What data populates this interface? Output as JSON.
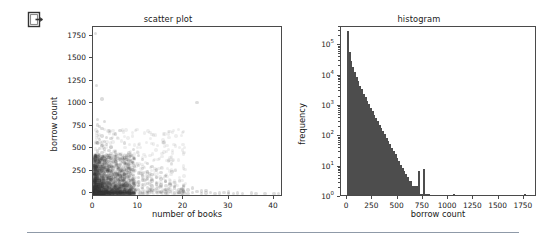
{
  "icon": {
    "name": "export-logout-icon"
  },
  "chart_data": [
    {
      "type": "scatter",
      "title": "scatter plot",
      "xlabel": "number of books",
      "ylabel": "borrow count",
      "xlim": [
        0,
        42
      ],
      "ylim": [
        -40,
        1850
      ],
      "xticks": [
        0,
        10,
        20,
        30,
        40
      ],
      "xtick_labels": [
        "0",
        "10",
        "20",
        "30",
        "40"
      ],
      "yticks": [
        0,
        250,
        500,
        750,
        1000,
        1250,
        1500,
        1750
      ],
      "ytick_labels": [
        "0",
        "250",
        "500",
        "750",
        "1000",
        "1250",
        "1500",
        "1750"
      ],
      "grid": false,
      "legend": "none",
      "marker_color": "#3f3f3f",
      "marker_alpha": 0.18,
      "description": "Dense semi-transparent cluster of points concentrated at low number-of-books (0-8) and low borrow count (0-400), thinning out toward higher values; a few sparse outliers up to 40 books and up to 1780 borrows.",
      "points": [
        [
          0.5,
          1780
        ],
        [
          1,
          760
        ],
        [
          1.5,
          745
        ],
        [
          2,
          720
        ],
        [
          1,
          690
        ],
        [
          2,
          640
        ],
        [
          3,
          620
        ],
        [
          1.5,
          600
        ],
        [
          2.5,
          580
        ],
        [
          1,
          560
        ],
        [
          3,
          545
        ],
        [
          2,
          530
        ],
        [
          4,
          515
        ],
        [
          1.5,
          500
        ],
        [
          2.5,
          495
        ],
        [
          3.5,
          480
        ],
        [
          1,
          470
        ],
        [
          5,
          460
        ],
        [
          2,
          455
        ],
        [
          4,
          445
        ],
        [
          3,
          435
        ],
        [
          6,
          430
        ],
        [
          1.5,
          425
        ],
        [
          2.5,
          415
        ],
        [
          5,
          405
        ],
        [
          3.5,
          400
        ],
        [
          7,
          395
        ],
        [
          2,
          390
        ],
        [
          4,
          385
        ],
        [
          1,
          380
        ],
        [
          6,
          375
        ],
        [
          3,
          370
        ],
        [
          8,
          365
        ],
        [
          2.5,
          360
        ],
        [
          5,
          355
        ],
        [
          1.5,
          350
        ],
        [
          4.5,
          345
        ],
        [
          9,
          340
        ],
        [
          3,
          335
        ],
        [
          7,
          330
        ],
        [
          2,
          325
        ],
        [
          6,
          320
        ],
        [
          1,
          315
        ],
        [
          10,
          310
        ],
        [
          4,
          305
        ],
        [
          3.5,
          300
        ],
        [
          8,
          295
        ],
        [
          2.5,
          290
        ],
        [
          5.5,
          285
        ],
        [
          1.5,
          280
        ],
        [
          11,
          275
        ],
        [
          7,
          270
        ],
        [
          3,
          265
        ],
        [
          9,
          260
        ],
        [
          2,
          255
        ],
        [
          6,
          250
        ],
        [
          4,
          245
        ],
        [
          12,
          240
        ],
        [
          1,
          238
        ],
        [
          8,
          235
        ],
        [
          5,
          230
        ],
        [
          3.5,
          228
        ],
        [
          10,
          225
        ],
        [
          2.5,
          220
        ],
        [
          7,
          215
        ],
        [
          13,
          212
        ],
        [
          4.5,
          208
        ],
        [
          1.5,
          205
        ],
        [
          9,
          200
        ],
        [
          6,
          198
        ],
        [
          3,
          195
        ],
        [
          11,
          192
        ],
        [
          2,
          190
        ],
        [
          8,
          188
        ],
        [
          5,
          185
        ],
        [
          14,
          182
        ],
        [
          4,
          180
        ],
        [
          1,
          178
        ],
        [
          10,
          175
        ],
        [
          7,
          172
        ],
        [
          3.5,
          170
        ],
        [
          12,
          168
        ],
        [
          2.5,
          165
        ],
        [
          6,
          162
        ],
        [
          9,
          160
        ],
        [
          15,
          158
        ],
        [
          5.5,
          155
        ],
        [
          4,
          152
        ],
        [
          1.5,
          150
        ],
        [
          11,
          148
        ],
        [
          8,
          145
        ],
        [
          3,
          142
        ],
        [
          13,
          140
        ],
        [
          2,
          138
        ],
        [
          7,
          135
        ],
        [
          6,
          132
        ],
        [
          16,
          130
        ],
        [
          10,
          128
        ],
        [
          4.5,
          125
        ],
        [
          5,
          122
        ],
        [
          1,
          120
        ],
        [
          9,
          118
        ],
        [
          3.5,
          115
        ],
        [
          12,
          112
        ],
        [
          2.5,
          110
        ],
        [
          8,
          108
        ],
        [
          14,
          105
        ],
        [
          6.5,
          102
        ],
        [
          4,
          100
        ],
        [
          11,
          98
        ],
        [
          1.5,
          96
        ],
        [
          7,
          94
        ],
        [
          17,
          92
        ],
        [
          5,
          90
        ],
        [
          3,
          88
        ],
        [
          10,
          86
        ],
        [
          13,
          84
        ],
        [
          2,
          82
        ],
        [
          8.5,
          80
        ],
        [
          6,
          78
        ],
        [
          15,
          76
        ],
        [
          4.5,
          74
        ],
        [
          9,
          72
        ],
        [
          1,
          70
        ],
        [
          12,
          68
        ],
        [
          3.5,
          66
        ],
        [
          7.5,
          64
        ],
        [
          18,
          62
        ],
        [
          5.5,
          60
        ],
        [
          2.5,
          58
        ],
        [
          11,
          56
        ],
        [
          14,
          54
        ],
        [
          8,
          52
        ],
        [
          4,
          50
        ],
        [
          6,
          48
        ],
        [
          16,
          46
        ],
        [
          10,
          44
        ],
        [
          1.5,
          42
        ],
        [
          9.5,
          40
        ],
        [
          3,
          38
        ],
        [
          13,
          36
        ],
        [
          20,
          34
        ],
        [
          7,
          32
        ],
        [
          5,
          30
        ],
        [
          12,
          28
        ],
        [
          2,
          26
        ],
        [
          17,
          24
        ],
        [
          8,
          22
        ],
        [
          15,
          20
        ],
        [
          4.5,
          18
        ],
        [
          11,
          16
        ],
        [
          6,
          14
        ],
        [
          19,
          12
        ],
        [
          9,
          10
        ],
        [
          22,
          9
        ],
        [
          14,
          8
        ],
        [
          3.5,
          7
        ],
        [
          25,
          6
        ],
        [
          18,
          5
        ],
        [
          12,
          4
        ],
        [
          7,
          3
        ],
        [
          28,
          3
        ],
        [
          21,
          2
        ],
        [
          16,
          2
        ],
        [
          30,
          2
        ],
        [
          24,
          1
        ],
        [
          33,
          1
        ],
        [
          36,
          1
        ],
        [
          40,
          1
        ],
        [
          27,
          1
        ],
        [
          31,
          2
        ],
        [
          20,
          25
        ],
        [
          23,
          18
        ],
        [
          26,
          12
        ],
        [
          29,
          8
        ],
        [
          19,
          45
        ],
        [
          21,
          38
        ],
        [
          24,
          28
        ],
        [
          22,
          60
        ],
        [
          25,
          35
        ],
        [
          18,
          80
        ],
        [
          20,
          70
        ],
        [
          17,
          110
        ],
        [
          16,
          140
        ],
        [
          15,
          95
        ],
        [
          14,
          120
        ],
        [
          13,
          155
        ],
        [
          12,
          185
        ],
        [
          30,
          15
        ],
        [
          32,
          5
        ],
        [
          35,
          4
        ],
        [
          38,
          2
        ],
        [
          41,
          1
        ],
        [
          2,
          1050
        ],
        [
          8,
          450
        ],
        [
          9,
          490
        ],
        [
          10,
          420
        ],
        [
          11,
          380
        ],
        [
          12,
          330
        ],
        [
          6,
          700
        ],
        [
          5,
          660
        ],
        [
          4,
          610
        ],
        [
          7,
          560
        ],
        [
          13,
          300
        ],
        [
          14,
          260
        ],
        [
          15,
          230
        ],
        [
          16,
          200
        ],
        [
          23,
          1010
        ],
        [
          1,
          820
        ],
        [
          2.5,
          800
        ],
        [
          0.8,
          1200
        ]
      ]
    },
    {
      "type": "bar",
      "subtype": "histogram",
      "title": "histogram",
      "xlabel": "borrow count",
      "ylabel": "frequency",
      "yscale": "log",
      "xlim": [
        -60,
        1880
      ],
      "ylim": [
        1,
        400000
      ],
      "xticks": [
        0,
        250,
        500,
        750,
        1000,
        1250,
        1500,
        1750
      ],
      "xtick_labels": [
        "0",
        "250",
        "500",
        "750",
        "1000",
        "1250",
        "1500",
        "1750"
      ],
      "yticks": [
        1,
        10,
        100,
        1000,
        10000,
        100000
      ],
      "ytick_labels": [
        "10",
        "10",
        "10",
        "10",
        "10",
        "10"
      ],
      "ytick_exponents": [
        "0",
        "1",
        "2",
        "3",
        "4",
        "5"
      ],
      "grid": false,
      "legend": "none",
      "bar_color": "#4d4d4d",
      "bin_width": 17.5,
      "description": "Strongly right-skewed distribution on a log frequency axis: peak above 2x10^5 in the first bin near 0, decaying roughly exponentially to single counts past 500, with isolated single-count bins out to ~1780.",
      "bins_left": [
        0,
        17.5,
        35,
        52.5,
        70,
        87.5,
        105,
        122.5,
        140,
        157.5,
        175,
        192.5,
        210,
        227.5,
        245,
        262.5,
        280,
        297.5,
        315,
        332.5,
        350,
        367.5,
        385,
        402.5,
        420,
        437.5,
        455,
        472.5,
        490,
        507.5,
        525,
        542.5,
        560,
        577.5,
        595,
        612.5,
        630,
        647.5,
        665,
        682.5,
        700,
        717.5,
        735,
        752.5,
        770,
        787.5,
        805,
        1050,
        1750
      ],
      "counts": [
        260000,
        52000,
        27000,
        17000,
        11500,
        8000,
        5600,
        4000,
        3000,
        2200,
        1700,
        1300,
        980,
        760,
        580,
        450,
        350,
        270,
        210,
        165,
        130,
        100,
        78,
        60,
        47,
        36,
        28,
        22,
        17,
        13,
        10,
        8,
        6,
        5,
        4,
        3,
        3,
        2,
        2,
        2,
        6,
        1,
        1,
        7,
        1,
        1,
        1,
        1,
        1
      ]
    }
  ]
}
